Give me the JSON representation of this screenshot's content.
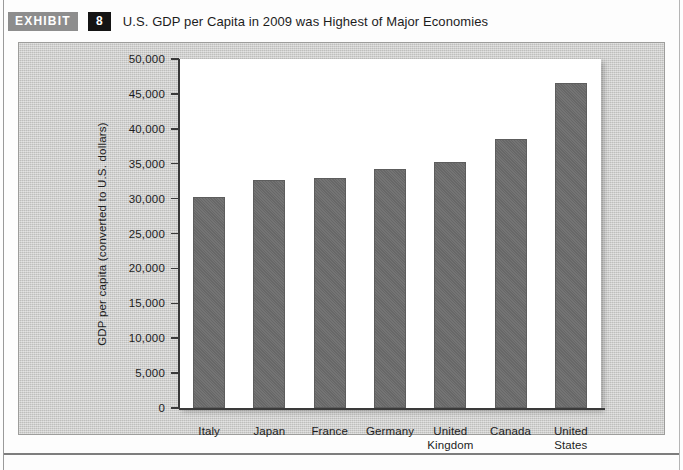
{
  "exhibit": {
    "tag_label": "EXHIBIT",
    "number": "8",
    "title": "U.S. GDP per Capita in 2009 was Highest of Major Economies"
  },
  "colors": {
    "bar": "#6d6d6d",
    "panel_background": "#cbcbc9",
    "plot_background": "#ffffff",
    "axis": "#3a3a3a",
    "tag_background": "#8d8d8d",
    "number_background": "#141414"
  },
  "chart_data": {
    "type": "bar",
    "title": "U.S. GDP per Capita in 2009 was Highest of Major Economies",
    "subtitle": "",
    "xlabel": "",
    "ylabel": "GDP per capita (converted to U.S. dollars)",
    "categories": [
      "Italy",
      "Japan",
      "France",
      "Germany",
      "United Kingdom",
      "Canada",
      "United States"
    ],
    "category_lines": [
      [
        "Italy"
      ],
      [
        "Japan"
      ],
      [
        "France"
      ],
      [
        "Germany"
      ],
      [
        "United",
        "Kingdom"
      ],
      [
        "Canada"
      ],
      [
        "United",
        "States"
      ]
    ],
    "values": [
      30300,
      32600,
      32900,
      34200,
      35300,
      38500,
      46600
    ],
    "ylim": [
      0,
      50000
    ],
    "ytick_values": [
      0,
      5000,
      10000,
      15000,
      20000,
      25000,
      30000,
      35000,
      40000,
      45000,
      50000
    ],
    "ytick_labels": [
      "0",
      "5,000",
      "10,000",
      "15,000",
      "20,000",
      "25,000",
      "30,000",
      "35,000",
      "40,000",
      "45,000",
      "50,000"
    ],
    "grid": false,
    "legend": null,
    "series": [
      {
        "name": "GDP per capita",
        "values": [
          30300,
          32600,
          32900,
          34200,
          35300,
          38500,
          46600
        ]
      }
    ]
  }
}
